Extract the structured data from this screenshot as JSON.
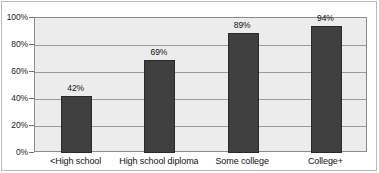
{
  "chart_data": {
    "type": "bar",
    "title": "",
    "subtitle": "",
    "xlabel": "",
    "ylabel": "",
    "categories": [
      "<High school",
      "High school diploma",
      "Some college",
      "College+"
    ],
    "values": [
      42,
      69,
      89,
      94
    ],
    "value_labels": [
      "42%",
      "69%",
      "89%",
      "94%"
    ],
    "ylim": [
      0,
      100
    ],
    "ytick_values": [
      0,
      20,
      40,
      60,
      80,
      100
    ],
    "ytick_labels": [
      "0%",
      "20%",
      "40%",
      "60%",
      "80%",
      "100%"
    ],
    "grid": true,
    "grid_orientation": "horizontal",
    "legend": false,
    "legend_position": "none",
    "series": [
      {
        "name": "",
        "values": [
          42,
          69,
          89,
          94
        ],
        "color": "#3f3f3f"
      }
    ],
    "colors": {
      "bar_fill": "#3f3f3f",
      "bar_border": "#2a2a2a",
      "plot_background": "#ececec",
      "plot_border": "#8c8c8c",
      "gridline": "#9a9a9a",
      "figure_background": "#ffffff",
      "outer_frame": "#b9b9b9",
      "text": "#111111"
    }
  }
}
